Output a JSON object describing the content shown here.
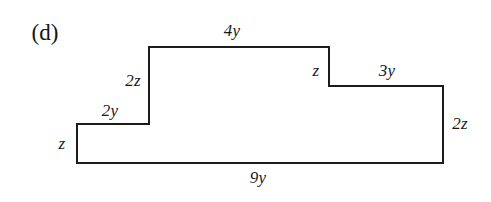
{
  "figure": {
    "part_label": "(d)",
    "shape": "step-polygon",
    "stroke_color": "#1c1c1c",
    "background_color": "#ffffff",
    "vertices": [
      [
        77,
        163
      ],
      [
        77,
        124
      ],
      [
        149,
        124
      ],
      [
        149,
        47
      ],
      [
        329,
        47
      ],
      [
        329,
        86
      ],
      [
        443,
        86
      ],
      [
        443,
        163
      ]
    ],
    "edge_labels": [
      {
        "name": "left-side",
        "text": "z",
        "x": 62,
        "y": 143
      },
      {
        "name": "lower-left-top",
        "text": "2y",
        "x": 110,
        "y": 110
      },
      {
        "name": "middle-riser",
        "text": "2z",
        "x": 133,
        "y": 80
      },
      {
        "name": "top",
        "text": "4y",
        "x": 232,
        "y": 30
      },
      {
        "name": "right-riser-upper",
        "text": "z",
        "x": 316,
        "y": 70
      },
      {
        "name": "right-step-top",
        "text": "3y",
        "x": 387,
        "y": 70
      },
      {
        "name": "right-side",
        "text": "2z",
        "x": 460,
        "y": 123
      },
      {
        "name": "bottom",
        "text": "9y",
        "x": 258,
        "y": 177
      }
    ]
  }
}
